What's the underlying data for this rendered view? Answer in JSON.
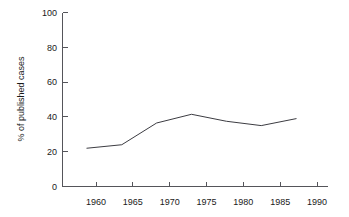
{
  "chart_data": {
    "type": "line",
    "title": "",
    "subtitle": "",
    "xlabel": "",
    "ylabel": "% of published cases",
    "x": [
      1960,
      1965,
      1970,
      1975,
      1980,
      1985,
      1990
    ],
    "categories": [
      "1960",
      "1965",
      "1970",
      "1975",
      "1980",
      "1985",
      "1990"
    ],
    "values": [
      22,
      24,
      36.5,
      41.5,
      37.5,
      35,
      39
    ],
    "series": [
      {
        "name": "% of published cases",
        "values": [
          22,
          24,
          36.5,
          41.5,
          37.5,
          35,
          39
        ]
      }
    ],
    "xlim": [
      1956.5,
      1994.5
    ],
    "ylim": [
      0,
      100
    ],
    "xticks": [
      1960,
      1965,
      1970,
      1975,
      1980,
      1985,
      1990
    ],
    "xtick_labels": [
      "1960",
      "1965",
      "1970",
      "1975",
      "1980",
      "1985",
      "1990"
    ],
    "yticks": [
      0,
      20,
      40,
      60,
      80,
      100
    ],
    "ytick_labels": [
      "0",
      "20",
      "40",
      "60",
      "80",
      "100"
    ],
    "grid": false,
    "legend": false,
    "legend_position": "none",
    "line_color": "#3c3c42",
    "axis_color": "#55555a",
    "background_color": "#ffffff"
  },
  "axis": {
    "y_title": "% of published cases",
    "y_labels": {
      "t0": "0",
      "t20": "20",
      "t40": "40",
      "t60": "60",
      "t80": "80",
      "t100": "100"
    },
    "x_labels": {
      "t1960": "1960",
      "t1965": "1965",
      "t1970": "1970",
      "t1975": "1975",
      "t1980": "1980",
      "t1985": "1985",
      "t1990": "1990"
    }
  }
}
